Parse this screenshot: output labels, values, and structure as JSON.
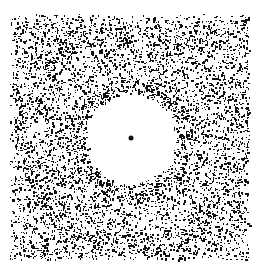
{
  "image": {
    "description": "Speckle / autocorrelation-like pattern: random black dots on white, clear central disk with a single center dot, surrounded by a denser hexagonal ring",
    "width": 257,
    "height": 267,
    "background": "#ffffff",
    "dot_color": "#111111",
    "field": {
      "x0": 10,
      "y0": 14,
      "x1": 250,
      "y1": 260
    },
    "center": {
      "x": 131,
      "y": 138
    },
    "center_dot_radius": 2.5,
    "clear_radius": 44,
    "ring_radius": 60,
    "ring_width": 10,
    "ring_sides": 6,
    "base_density": 0.33,
    "ring_density": 0.6,
    "outer_ring_radius": 118,
    "outer_ring_density": 0.45
  }
}
